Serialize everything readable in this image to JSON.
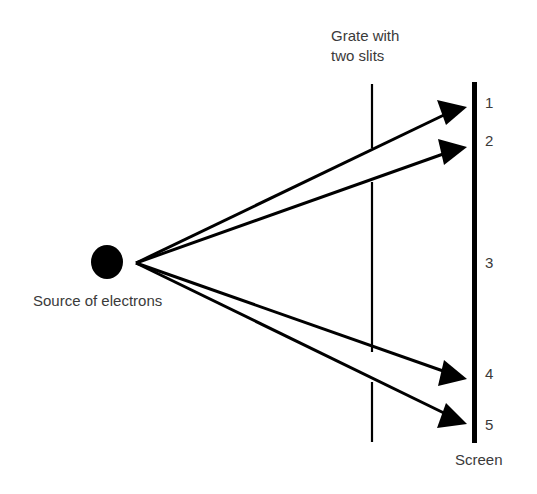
{
  "labels": {
    "grate": [
      "Grate with",
      "two slits"
    ],
    "source": "Source of electrons",
    "screen": "Screen"
  },
  "screen_positions": [
    "1",
    "2",
    "3",
    "4",
    "5"
  ],
  "colors": {
    "ink": "#000000",
    "text": "#3a3a3a",
    "background": "#ffffff"
  },
  "geometry": {
    "source": {
      "cx": 107,
      "cy": 262,
      "r": 16
    },
    "origin": {
      "x": 136,
      "y": 263
    },
    "grate_x": 372,
    "screen_x": 474,
    "arrow_tips": [
      [
        467,
        107
      ],
      [
        467,
        147
      ],
      [
        467,
        379
      ],
      [
        467,
        424
      ]
    ]
  }
}
